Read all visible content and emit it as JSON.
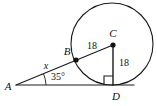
{
  "figure": {
    "background_color": "#ffffff",
    "stroke_color": "#1a1a1a",
    "text_color": "#111111",
    "width": 157,
    "height": 106
  },
  "points": [
    {
      "id": "A",
      "label": "A",
      "x": 16,
      "y": 85,
      "label_x": 8,
      "label_y": 89,
      "dot": false,
      "role": "external-vertex"
    },
    {
      "id": "B",
      "label": "B",
      "x": 76,
      "y": 60,
      "label_x": 66,
      "label_y": 55,
      "dot": true,
      "role": "tangent-point"
    },
    {
      "id": "C",
      "label": "C",
      "x": 113,
      "y": 45,
      "label_x": 112,
      "label_y": 36,
      "dot": true,
      "role": "circle-center"
    },
    {
      "id": "D",
      "label": "D",
      "x": 113,
      "y": 85,
      "label_x": 114,
      "label_y": 99,
      "dot": false,
      "role": "tangent-point"
    }
  ],
  "circle": {
    "center_x": 112,
    "center_y": 44,
    "radius": 41
  },
  "segments": [
    {
      "id": "AC",
      "from": "A",
      "to": "C",
      "x1": 16,
      "y1": 85,
      "x2": 113,
      "y2": 45
    },
    {
      "id": "AD",
      "from": "A",
      "to": "D",
      "x1": 16,
      "y1": 85,
      "x2": 131,
      "y2": 85
    },
    {
      "id": "CD",
      "from": "C",
      "to": "D",
      "x1": 113,
      "y1": 45,
      "x2": 113,
      "y2": 85
    }
  ],
  "measure_labels": [
    {
      "id": "bc-length",
      "text": "18",
      "x": 92,
      "y": 45,
      "segment": "BC"
    },
    {
      "id": "cd-length",
      "text": "18",
      "x": 124,
      "y": 62,
      "segment": "CD"
    },
    {
      "id": "ab-length",
      "text": "x",
      "x": 46,
      "y": 66,
      "segment": "AB"
    },
    {
      "id": "angle-a",
      "text": "35°",
      "x": 57,
      "y": 78,
      "segment": "angle-A"
    }
  ],
  "angle_arc": {
    "vertex": "A",
    "path": "M 46 85 A 30 30 0 0 0 43.6 73.8",
    "measure": "35°"
  },
  "right_angle": {
    "at": "D",
    "size": 9,
    "x": 104,
    "y": 76
  }
}
